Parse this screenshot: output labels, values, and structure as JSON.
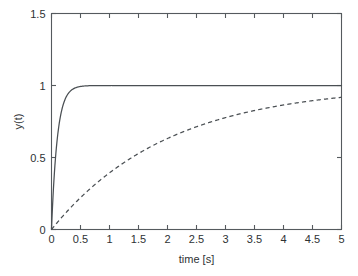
{
  "chart_data": {
    "type": "line",
    "title": "",
    "xlabel": "time [s]",
    "ylabel": "y(t)",
    "xlim": [
      0,
      5
    ],
    "ylim": [
      0,
      1.5
    ],
    "xticks": [
      0,
      0.5,
      1,
      1.5,
      2,
      2.5,
      3,
      3.5,
      4,
      4.5,
      5
    ],
    "xticklabels": [
      "0",
      "0.5",
      "1",
      "1.5",
      "2",
      "2.5",
      "3",
      "3.5",
      "4",
      "4.5",
      "5"
    ],
    "yticks": [
      0,
      0.5,
      1,
      1.5
    ],
    "yticklabels": [
      "0",
      "0.5",
      "1",
      "1.5"
    ],
    "grid": false,
    "legend": "none",
    "box": true,
    "tick_direction": "in",
    "series": [
      {
        "name": "fast first-order step response",
        "style": "solid",
        "color": "#4a4f53",
        "description": "y(t) = 1 - exp(-t/0.1)",
        "time_constant": 0.1,
        "x": [
          0,
          0.05,
          0.1,
          0.15,
          0.2,
          0.25,
          0.3,
          0.35,
          0.4,
          0.5,
          0.6,
          0.7,
          0.8,
          0.9,
          1,
          1.25,
          1.5,
          1.75,
          2,
          2.5,
          3,
          3.5,
          4,
          4.5,
          5
        ],
        "values": [
          0,
          0.393,
          0.632,
          0.777,
          0.865,
          0.918,
          0.95,
          0.97,
          0.982,
          0.993,
          0.998,
          0.999,
          1,
          1,
          1,
          1,
          1,
          1,
          1,
          1,
          1,
          1,
          1,
          1,
          1
        ]
      },
      {
        "name": "slow first-order step response",
        "style": "dashed",
        "color": "#4a4f53",
        "description": "y(t) = 1 - exp(-t/2)",
        "time_constant": 2,
        "x": [
          0,
          0.25,
          0.5,
          0.75,
          1,
          1.25,
          1.5,
          1.75,
          2,
          2.25,
          2.5,
          2.75,
          3,
          3.25,
          3.5,
          3.75,
          4,
          4.25,
          4.5,
          4.75,
          5
        ],
        "values": [
          0,
          0.118,
          0.221,
          0.313,
          0.393,
          0.465,
          0.528,
          0.583,
          0.632,
          0.675,
          0.713,
          0.747,
          0.777,
          0.803,
          0.826,
          0.847,
          0.865,
          0.881,
          0.895,
          0.907,
          0.918
        ]
      }
    ]
  }
}
